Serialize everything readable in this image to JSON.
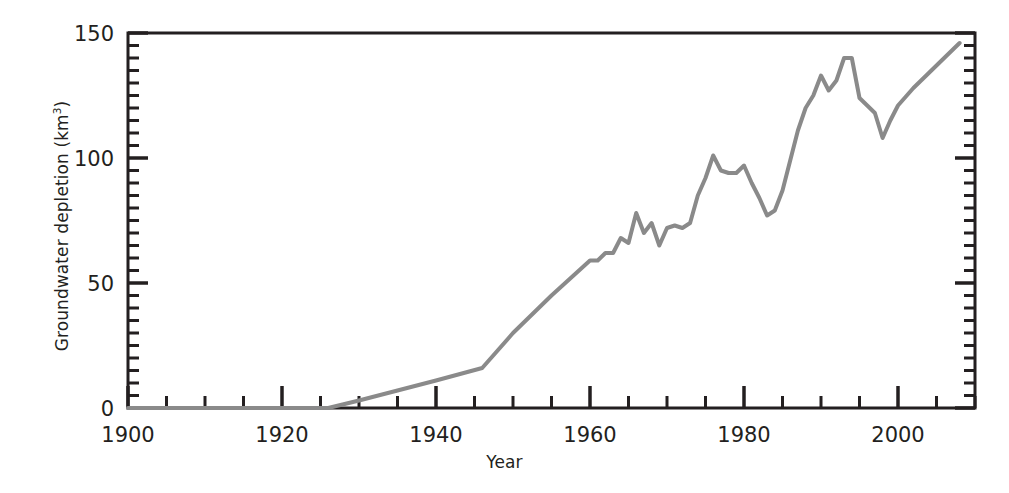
{
  "chart_data": {
    "type": "line",
    "title": "",
    "subtitle": "",
    "xlabel": "Year",
    "ylabel": "Groundwater depletion (km3)",
    "ylabel_base": "Groundwater depletion (km",
    "ylabel_exponent": "3",
    "ylabel_suffix": ")",
    "xlim": [
      1900,
      2010
    ],
    "ylim": [
      0,
      150
    ],
    "x_major_ticks": [
      1900,
      1920,
      1940,
      1960,
      1980,
      2000
    ],
    "x_major_tick_labels": [
      "1900",
      "1920",
      "1940",
      "1960",
      "1980",
      "2000"
    ],
    "x_minor_tick_step": 5,
    "y_major_ticks": [
      0,
      50,
      100,
      150
    ],
    "y_major_tick_labels": [
      "0",
      "50",
      "100",
      "150"
    ],
    "y_minor_tick_step": 5,
    "grid": false,
    "legend": null,
    "legend_position": "none",
    "line_color": "#8a8a8a",
    "axis_color": "#231f20",
    "background_color": "#ffffff",
    "line_width_px": 4,
    "series": [
      {
        "name": "Groundwater depletion",
        "x": [
          1900,
          1926,
          1930,
          1935,
          1940,
          1946,
          1950,
          1955,
          1960,
          1961,
          1962,
          1963,
          1964,
          1965,
          1966,
          1967,
          1968,
          1969,
          1970,
          1971,
          1972,
          1973,
          1974,
          1975,
          1976,
          1977,
          1978,
          1979,
          1980,
          1981,
          1982,
          1983,
          1984,
          1985,
          1986,
          1987,
          1988,
          1989,
          1990,
          1991,
          1992,
          1993,
          1994,
          1995,
          1996,
          1997,
          1998,
          1999,
          2000,
          2002,
          2004,
          2006,
          2008
        ],
        "y": [
          0,
          0,
          3,
          7,
          11,
          16,
          30,
          45,
          59,
          59,
          62,
          62,
          68,
          66,
          78,
          70,
          74,
          65,
          72,
          73,
          72,
          74,
          85,
          92,
          101,
          95,
          94,
          94,
          97,
          90,
          84,
          77,
          79,
          87,
          99,
          111,
          120,
          125,
          133,
          127,
          131,
          140,
          140,
          124,
          121,
          118,
          108,
          115,
          121,
          128,
          134,
          140,
          146
        ]
      }
    ]
  }
}
